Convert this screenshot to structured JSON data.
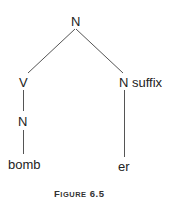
{
  "diagram": {
    "type": "tree",
    "nodes": {
      "root": "N",
      "left": "V",
      "right": "N",
      "right_annotation": "suffix",
      "left_child": "N",
      "left_leaf": "bomb",
      "right_leaf": "er"
    },
    "edges": [
      [
        "root",
        "left"
      ],
      [
        "root",
        "right"
      ],
      [
        "left",
        "left_child"
      ],
      [
        "left_child",
        "left_leaf"
      ],
      [
        "right",
        "right_leaf"
      ]
    ],
    "line_color": "#555555"
  },
  "caption": {
    "first_letter": "F",
    "rest": "IGURE",
    "number": "6.5"
  }
}
